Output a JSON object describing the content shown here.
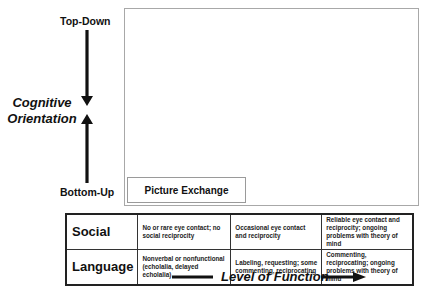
{
  "vertical_axis": {
    "title_line1": "Cognitive",
    "title_line2": "Orientation",
    "top_label": "Top-Down",
    "bottom_label": "Bottom-Up"
  },
  "plot_area": {
    "items": [
      {
        "label": "Picture Exchange"
      }
    ]
  },
  "table": {
    "rows": [
      {
        "header": "Social",
        "cells": [
          "No or rare eye contact; no social reciprocity",
          "Occasional eye contact and reciprocity",
          "Reliable eye contact and reciprocity; ongoing problems with theory of mind"
        ]
      },
      {
        "header": "Language",
        "cells": [
          "Nonverbal or nonfunctional (echolalia, delayed echolalia)",
          "Labeling, requesting; some commenting, reciprocating",
          "Commenting, reciprocating; ongoing problems with theory of mind"
        ]
      }
    ]
  },
  "horizontal_axis": {
    "title": "Level of Function"
  },
  "colors": {
    "box_border": "#a8a8a8",
    "table_border": "#222222",
    "arrow": "#111111"
  }
}
